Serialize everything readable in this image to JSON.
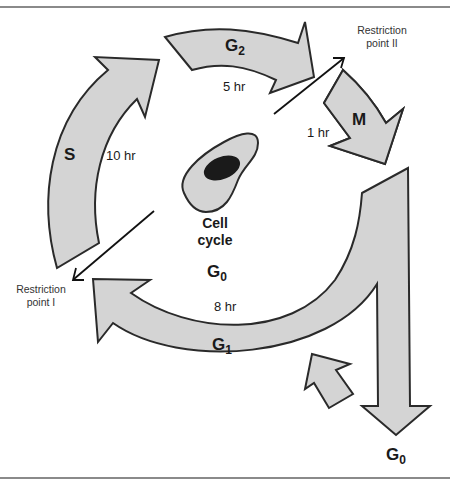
{
  "diagram": {
    "title": "Cell cycle",
    "center_label": [
      "Cell",
      "cycle"
    ],
    "center_phase": {
      "main": "G",
      "sub": "0"
    },
    "phases": [
      {
        "id": "S",
        "main": "S",
        "sub": "",
        "duration": "10 hr"
      },
      {
        "id": "G2",
        "main": "G",
        "sub": "2",
        "duration": "5 hr"
      },
      {
        "id": "M",
        "main": "M",
        "sub": "",
        "duration": "1 hr"
      },
      {
        "id": "G1",
        "main": "G",
        "sub": "1",
        "duration": "8 hr"
      }
    ],
    "exit_phase": {
      "main": "G",
      "sub": "0"
    },
    "restriction_points": [
      {
        "id": "I",
        "line1": "Restriction",
        "line2": "point I"
      },
      {
        "id": "II",
        "line1": "Restriction",
        "line2": "point II"
      }
    ],
    "colors": {
      "arrow_fill": "#d4d4d4",
      "outline": "#2a2a2a",
      "nucleus": "#1a1a1a",
      "rule": "#8a8a8a"
    }
  }
}
